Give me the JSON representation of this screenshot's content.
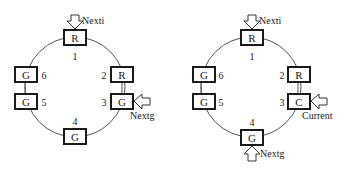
{
  "diagrams": [
    {
      "id": "left",
      "nodes": [
        {
          "pos": "1",
          "label": "R"
        },
        {
          "pos": "2",
          "label": "R"
        },
        {
          "pos": "3",
          "label": "G"
        },
        {
          "pos": "4",
          "label": "G"
        },
        {
          "pos": "5",
          "label": "G"
        },
        {
          "pos": "6",
          "label": "G"
        }
      ],
      "pointers": [
        {
          "label": "Nexti",
          "target": "1"
        },
        {
          "label": "Nextg",
          "target": "3"
        }
      ]
    },
    {
      "id": "right",
      "nodes": [
        {
          "pos": "1",
          "label": "R"
        },
        {
          "pos": "2",
          "label": "R"
        },
        {
          "pos": "3",
          "label": "C"
        },
        {
          "pos": "4",
          "label": "G"
        },
        {
          "pos": "5",
          "label": "G"
        },
        {
          "pos": "6",
          "label": "G"
        }
      ],
      "pointers": [
        {
          "label": "Nexti",
          "target": "1"
        },
        {
          "label": "Current",
          "target": "3"
        },
        {
          "label": "Nextg",
          "target": "4"
        }
      ]
    }
  ],
  "colors": {
    "stroke": "#1a1a1a",
    "ring": "#555555",
    "background": "#ffffff"
  }
}
